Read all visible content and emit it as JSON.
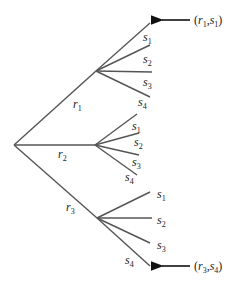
{
  "diagram": {
    "type": "tree",
    "root": {
      "x": 14,
      "y": 145
    },
    "first_level": [
      {
        "label": "r",
        "sub": "1",
        "node": {
          "x": 96,
          "y": 71
        },
        "label_pos": {
          "x": 73,
          "y": 108
        }
      },
      {
        "label": "r",
        "sub": "2",
        "node": {
          "x": 95,
          "y": 145
        },
        "label_pos": {
          "x": 58,
          "y": 158
        }
      },
      {
        "label": "r",
        "sub": "3",
        "node": {
          "x": 97,
          "y": 218
        },
        "label_pos": {
          "x": 66,
          "y": 211
        }
      }
    ],
    "branches": [
      {
        "parent": "r1",
        "children": [
          {
            "label": "s",
            "sub": "1",
            "end": {
              "x": 150,
              "y": 23
            },
            "label_pos": {
              "x": 143,
              "y": 41
            }
          },
          {
            "label": "s",
            "sub": "2",
            "end": {
              "x": 150,
              "y": 45
            },
            "label_pos": {
              "x": 143,
              "y": 63
            }
          },
          {
            "label": "s",
            "sub": "3",
            "end": {
              "x": 152,
              "y": 72
            },
            "label_pos": {
              "x": 143,
              "y": 86
            }
          },
          {
            "label": "s",
            "sub": "4",
            "end": {
              "x": 150,
              "y": 97
            },
            "label_pos": {
              "x": 138,
              "y": 106
            }
          }
        ]
      },
      {
        "parent": "r2",
        "children": [
          {
            "label": "s",
            "sub": "1",
            "end": {
              "x": 137,
              "y": 114
            },
            "label_pos": {
              "x": 132,
              "y": 130
            }
          },
          {
            "label": "s",
            "sub": "2",
            "end": {
              "x": 139,
              "y": 133
            },
            "label_pos": {
              "x": 134,
              "y": 146
            }
          },
          {
            "label": "s",
            "sub": "3",
            "end": {
              "x": 139,
              "y": 155
            },
            "label_pos": {
              "x": 132,
              "y": 166
            }
          },
          {
            "label": "s",
            "sub": "4",
            "end": {
              "x": 137,
              "y": 175
            },
            "label_pos": {
              "x": 125,
              "y": 181
            }
          }
        ]
      },
      {
        "parent": "r3",
        "children": [
          {
            "label": "s",
            "sub": "1",
            "end": {
              "x": 150,
              "y": 192
            },
            "label_pos": {
              "x": 157,
              "y": 198
            }
          },
          {
            "label": "s",
            "sub": "2",
            "end": {
              "x": 152,
              "y": 218
            },
            "label_pos": {
              "x": 157,
              "y": 224
            }
          },
          {
            "label": "s",
            "sub": "3",
            "end": {
              "x": 150,
              "y": 243
            },
            "label_pos": {
              "x": 157,
              "y": 249
            }
          },
          {
            "label": "s",
            "sub": "4",
            "end": {
              "x": 150,
              "y": 266
            },
            "label_pos": {
              "x": 125,
              "y": 264
            }
          }
        ]
      }
    ],
    "annotations": [
      {
        "text_a": "r",
        "sub_a": "1",
        "text_b": "s",
        "sub_b": "1",
        "arrow": {
          "x1": 190,
          "y1": 20,
          "x2": 156,
          "y2": 20
        },
        "label_pos": {
          "x": 194,
          "y": 24
        }
      },
      {
        "text_a": "r",
        "sub_a": "3",
        "text_b": "s",
        "sub_b": "4",
        "arrow": {
          "x1": 190,
          "y1": 266,
          "x2": 156,
          "y2": 266
        },
        "label_pos": {
          "x": 194,
          "y": 270
        }
      }
    ],
    "colors": {
      "edge": "#555555",
      "arrow": "#111111",
      "text": "#222222",
      "background": "#ffffff"
    }
  }
}
